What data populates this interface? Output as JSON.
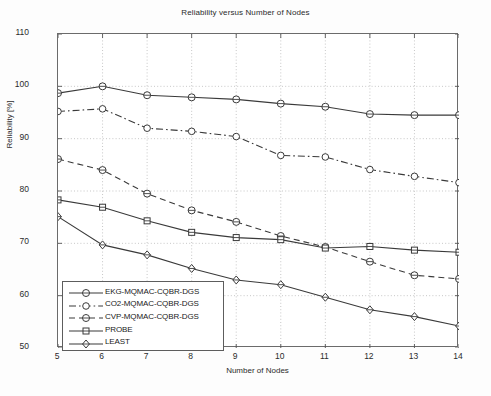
{
  "chart_data": {
    "type": "line",
    "title": "Reliability versus Number of Nodes",
    "xlabel": "Number of Nodes",
    "ylabel": "Reliability [%]",
    "x": [
      5,
      6,
      7,
      8,
      9,
      10,
      11,
      12,
      13,
      14
    ],
    "xlim": [
      5,
      14
    ],
    "ylim": [
      50,
      110
    ],
    "xticks": [
      "5",
      "6",
      "7",
      "8",
      "9",
      "10",
      "11",
      "12",
      "13",
      "14"
    ],
    "yticks": [
      "50",
      "60",
      "70",
      "80",
      "90",
      "100",
      "110"
    ],
    "grid": true,
    "legend_position": "lower left",
    "series": [
      {
        "name": "EKG-MQMAC-CQBR-DGS",
        "marker": "circle",
        "linestyle": "solid",
        "color": "#3a3a3a",
        "values": [
          98.7,
          100.0,
          98.3,
          97.9,
          97.5,
          96.7,
          96.1,
          94.7,
          94.5,
          94.5
        ]
      },
      {
        "name": "CO2-MQMAC-CQBR-DGS",
        "marker": "circle-open",
        "linestyle": "dashdot",
        "color": "#3a3a3a",
        "values": [
          95.2,
          95.7,
          92.0,
          91.4,
          90.4,
          86.8,
          86.5,
          84.1,
          82.8,
          81.6
        ]
      },
      {
        "name": "CVP-MQMAC-CQBR-DGS",
        "marker": "circle",
        "linestyle": "dashed",
        "color": "#3a3a3a",
        "values": [
          86.1,
          84.0,
          79.5,
          76.3,
          74.1,
          71.4,
          69.3,
          66.5,
          63.9,
          63.2
        ]
      },
      {
        "name": "PROBE",
        "marker": "square",
        "linestyle": "solid",
        "color": "#3a3a3a",
        "values": [
          78.3,
          76.9,
          74.3,
          72.1,
          71.1,
          70.7,
          69.1,
          69.4,
          68.7,
          68.3
        ]
      },
      {
        "name": "LEAST",
        "marker": "diamond",
        "linestyle": "solid",
        "color": "#3a3a3a",
        "values": [
          75.1,
          69.7,
          67.8,
          65.2,
          63.0,
          62.1,
          59.7,
          57.3,
          56.0,
          54.2
        ]
      }
    ]
  }
}
